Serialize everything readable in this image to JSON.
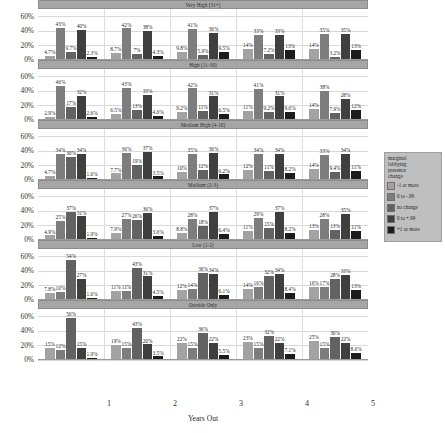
{
  "chart_data": {
    "type": "bar",
    "title": "",
    "xlabel": "Years Out",
    "ylabel": "",
    "ylim": [
      0,
      70
    ],
    "yticks": [
      "0%",
      "20%",
      "40%",
      "60%"
    ],
    "ytick_values": [
      0,
      20,
      40,
      60
    ],
    "categories": [
      "1",
      "2",
      "3",
      "4",
      "5"
    ],
    "grid": true,
    "legend_position": "right",
    "legend": {
      "title": "marginal lobbying presence change",
      "title_lines": [
        "marginal",
        "lobbying",
        "presence",
        "change"
      ],
      "entries": [
        {
          "label": "-1 or more",
          "color": "#a3a3a3"
        },
        {
          "label": "0 to -.99",
          "color": "#7d7d7d"
        },
        {
          "label": "no change",
          "color": "#626262"
        },
        {
          "label": "0 to +.99",
          "color": "#3f3f3f"
        },
        {
          "label": "+1 or more",
          "color": "#1c1c1c"
        }
      ]
    },
    "series": [
      {
        "name": "-1 or more",
        "color": "#a3a3a3"
      },
      {
        "name": "0 to -.99",
        "color": "#7d7d7d"
      },
      {
        "name": "no change",
        "color": "#626262"
      },
      {
        "name": "0 to +.99",
        "color": "#3f3f3f"
      },
      {
        "name": "+1 or more",
        "color": "#1c1c1c"
      }
    ],
    "panels": [
      {
        "title": "Very High (31+)",
        "groups": [
          {
            "x": "1",
            "values": [
              4.7,
              43,
              9.7,
              40,
              2.3
            ],
            "labels": [
              "4.7%",
              "43%",
              "9.7%",
              "40%",
              "2.3%"
            ]
          },
          {
            "x": "2",
            "values": [
              8.7,
              42,
              7,
              38,
              4.3
            ],
            "labels": [
              "8.7%",
              "42%",
              "7%",
              "38%",
              "4.3%"
            ]
          },
          {
            "x": "3",
            "values": [
              9.8,
              41,
              5.9,
              36,
              9.5
            ],
            "labels": [
              "9.8%",
              "41%",
              "5.9%",
              "36%",
              "9.5%"
            ]
          },
          {
            "x": "4",
            "values": [
              14,
              33,
              7.2,
              33,
              13
            ],
            "labels": [
              "14%",
              "33%",
              "7.2%",
              "33%",
              "13%"
            ]
          },
          {
            "x": "5",
            "values": [
              14,
              35,
              3.2,
              35,
              13
            ],
            "labels": [
              "14%",
              "35%",
              "3.2%",
              "35%",
              "13%"
            ]
          }
        ]
      },
      {
        "title": "High (11-30)",
        "groups": [
          {
            "x": "1",
            "values": [
              2.9,
              46,
              17,
              32,
              2.6
            ],
            "labels": [
              "2.9%",
              "46%",
              "17%",
              "32%",
              "2.6%"
            ]
          },
          {
            "x": "2",
            "values": [
              6.5,
              43,
              13,
              33,
              4.6
            ],
            "labels": [
              "6.5%",
              "43%",
              "13%",
              "33%",
              "4.6%"
            ]
          },
          {
            "x": "3",
            "values": [
              9.2,
              42,
              11,
              31,
              6.5
            ],
            "labels": [
              "9.2%",
              "42%",
              "11%",
              "31%",
              "6.5%"
            ]
          },
          {
            "x": "4",
            "values": [
              11,
              41,
              9.2,
              31,
              9.6
            ],
            "labels": [
              "11%",
              "41%",
              "9.2%",
              "31%",
              "9.6%"
            ]
          },
          {
            "x": "5",
            "values": [
              14,
              38,
              7.9,
              28,
              12
            ],
            "labels": [
              "14%",
              "38%",
              "7.9%",
              "28%",
              "12%"
            ]
          }
        ]
      },
      {
        "title": "Medium High (4-10)",
        "groups": [
          {
            "x": "1",
            "values": [
              4.7,
              34,
              30,
              34,
              1.6
            ],
            "labels": [
              "4.7%",
              "34%",
              "30%",
              "34%",
              "1.6%"
            ]
          },
          {
            "x": "2",
            "values": [
              7.7,
              36,
              19,
              37,
              3.5
            ],
            "labels": [
              "7.7%",
              "36%",
              "19%",
              "37%",
              "3.5%"
            ]
          },
          {
            "x": "3",
            "values": [
              10,
              35,
              12,
              36,
              6.2
            ],
            "labels": [
              "10%",
              "35%",
              "12%",
              "36%",
              "6.2%"
            ]
          },
          {
            "x": "4",
            "values": [
              12,
              34,
              11,
              34,
              8.2
            ],
            "labels": [
              "12%",
              "34%",
              "11%",
              "34%",
              "8.2%"
            ]
          },
          {
            "x": "5",
            "values": [
              14,
              33,
              9.4,
              34,
              11
            ],
            "labels": [
              "14%",
              "33%",
              "9.4%",
              "34%",
              "11%"
            ]
          }
        ]
      },
      {
        "title": "Medium (2-3)",
        "groups": [
          {
            "x": "1",
            "values": [
              4.9,
              25,
              37,
              31,
              1.9
            ],
            "labels": [
              "4.9%",
              "25%",
              "37%",
              "31%",
              "1.9%"
            ]
          },
          {
            "x": "2",
            "values": [
              7.9,
              27,
              26,
              36,
              3.6
            ],
            "labels": [
              "7.9%",
              "27%",
              "26%",
              "36%",
              "3.6%"
            ]
          },
          {
            "x": "3",
            "values": [
              8.8,
              28,
              18,
              37,
              6.4
            ],
            "labels": [
              "8.8%",
              "28%",
              "18%",
              "37%",
              "6.4%"
            ]
          },
          {
            "x": "4",
            "values": [
              11,
              29,
              15,
              37,
              8.2
            ],
            "labels": [
              "11%",
              "29%",
              "15%",
              "37%",
              "8.2%"
            ]
          },
          {
            "x": "5",
            "values": [
              13,
              28,
              13,
              35,
              11
            ],
            "labels": [
              "13%",
              "28%",
              "13%",
              "35%",
              "11%"
            ]
          }
        ]
      },
      {
        "title": "Low (1-2)",
        "groups": [
          {
            "x": "1",
            "values": [
              7.8,
              10,
              54,
              27,
              1.6
            ],
            "labels": [
              "7.8%",
              "10%",
              "54%",
              "27%",
              "1.6%"
            ]
          },
          {
            "x": "2",
            "values": [
              11,
              11,
              43,
              31,
              4.5
            ],
            "labels": [
              "11%",
              "11%",
              "43%",
              "31%",
              "4.5%"
            ]
          },
          {
            "x": "3",
            "values": [
              12,
              14,
              36,
              34,
              6.1
            ],
            "labels": [
              "12%",
              "14%",
              "36%",
              "34%",
              "6.1%"
            ]
          },
          {
            "x": "4",
            "values": [
              14,
              16,
              32,
              34,
              8.4
            ],
            "labels": [
              "14%",
              "16%",
              "32%",
              "34%",
              "8.4%"
            ]
          },
          {
            "x": "5",
            "values": [
              16,
              17,
              28,
              33,
              13
            ],
            "labels": [
              "16%",
              "17%",
              "28%",
              "33%",
              "13%"
            ]
          }
        ]
      },
      {
        "title": "Outside Only",
        "groups": [
          {
            "x": "1",
            "values": [
              15,
              12,
              56,
              15,
              1.9
            ],
            "labels": [
              "15%",
              "12%",
              "56%",
              "15%",
              "1.9%"
            ]
          },
          {
            "x": "2",
            "values": [
              19,
              15,
              43,
              20,
              3.5
            ],
            "labels": [
              "19%",
              "15%",
              "43%",
              "20%",
              "3.5%"
            ]
          },
          {
            "x": "3",
            "values": [
              22,
              15,
              36,
              22,
              5.5
            ],
            "labels": [
              "22%",
              "15%",
              "36%",
              "22%",
              "5.5%"
            ]
          },
          {
            "x": "4",
            "values": [
              23,
              15,
              32,
              22,
              7.1
            ],
            "labels": [
              "23%",
              "15%",
              "32%",
              "22%",
              "7.1%"
            ]
          },
          {
            "x": "5",
            "values": [
              25,
              15,
              30,
              22,
              8.6
            ],
            "labels": [
              "25%",
              "15%",
              "30%",
              "22%",
              "8.6%"
            ]
          }
        ]
      }
    ]
  }
}
